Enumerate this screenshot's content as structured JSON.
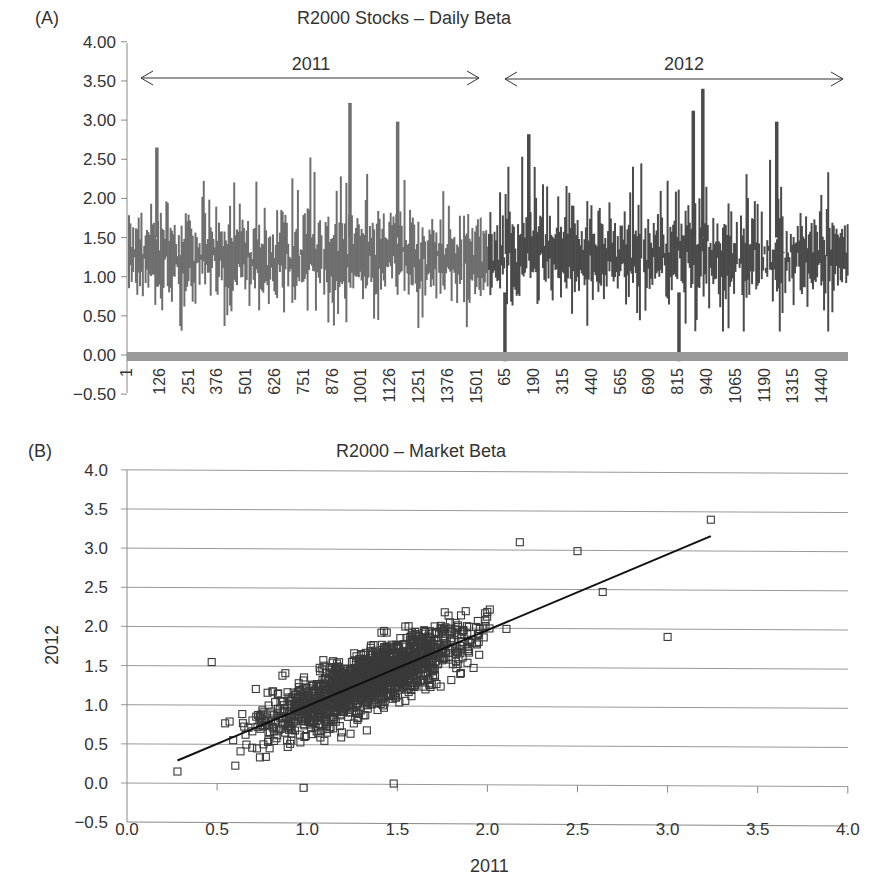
{
  "panelA": {
    "label": "(A)",
    "title": "R2000 Stocks – Daily Beta",
    "year_left": "2011",
    "year_right": "2012",
    "y_ticks": [
      "4.00",
      "3.50",
      "3.00",
      "2.50",
      "2.00",
      "1.50",
      "1.00",
      "0.50",
      "0.00",
      "−0.50"
    ],
    "x_ticks_2011": [
      "1",
      "126",
      "251",
      "376",
      "501",
      "626",
      "751",
      "876",
      "1001",
      "1126",
      "1251",
      "1376",
      "1501"
    ],
    "x_ticks_2012": [
      "65",
      "190",
      "315",
      "440",
      "565",
      "690",
      "815",
      "940",
      "1065",
      "1190",
      "1315",
      "1440"
    ],
    "colors": {
      "series_2011": "#6e6e6e",
      "series_2012": "#4a4a4a",
      "zero_band": "#9a9a9a"
    }
  },
  "panelB": {
    "label": "(B)",
    "title": "R2000 – Market Beta",
    "x_title": "2011",
    "y_title": "2012",
    "y_ticks": [
      "4.0",
      "3.5",
      "3.0",
      "2.5",
      "2.0",
      "1.5",
      "1.0",
      "0.5",
      "0.0",
      "−0.5"
    ],
    "x_ticks": [
      "0.0",
      "0.5",
      "1.0",
      "1.5",
      "2.0",
      "2.5",
      "3.0",
      "3.5",
      "4.0"
    ],
    "colors": {
      "marker": "#3a3a3a",
      "trend": "#111111",
      "grid": "#999999"
    }
  },
  "chart_data": [
    {
      "type": "bar",
      "title": "R2000 Stocks – Daily Beta",
      "xlabel": "",
      "ylabel": "",
      "ylim": [
        -0.5,
        4.0
      ],
      "grid": false,
      "annotations": [
        {
          "text": "2011",
          "span": "left half (obs 1–~1510)"
        },
        {
          "text": "2012",
          "span": "right half (obs 1–~1510)"
        }
      ],
      "categories_2011": [
        "1",
        "126",
        "251",
        "376",
        "501",
        "626",
        "751",
        "876",
        "1001",
        "1126",
        "1251",
        "1376",
        "1501"
      ],
      "categories_2012": [
        "65",
        "190",
        "315",
        "440",
        "565",
        "690",
        "815",
        "940",
        "1065",
        "1190",
        "1315",
        "1440"
      ],
      "series": [
        {
          "name": "2011",
          "typical_range": [
            0.7,
            2.0
          ],
          "max": 3.22,
          "min": 0.27,
          "notable_peaks": [
            {
              "obs": 930,
              "value": 3.22
            },
            {
              "obs": 1130,
              "value": 2.98
            },
            {
              "obs": 120,
              "value": 2.65
            }
          ]
        },
        {
          "name": "2012",
          "typical_range": [
            0.6,
            2.0
          ],
          "max": 3.4,
          "min": -0.08,
          "notable_peaks": [
            {
              "obs": 900,
              "value": 3.4
            },
            {
              "obs": 860,
              "value": 3.12
            },
            {
              "obs": 1210,
              "value": 2.98
            },
            {
              "obs": 170,
              "value": 2.82
            }
          ],
          "notable_troughs": [
            {
              "obs": 70,
              "value": -0.08
            },
            {
              "obs": 800,
              "value": -0.08
            }
          ]
        }
      ]
    },
    {
      "type": "scatter",
      "title": "R2000 – Market Beta",
      "xlabel": "2011",
      "ylabel": "2012",
      "xlim": [
        0.0,
        4.0
      ],
      "ylim": [
        -0.5,
        4.0
      ],
      "grid": "horizontal",
      "marker": "open square",
      "trendline": {
        "x": [
          0.28,
          3.24
        ],
        "y": [
          0.29,
          3.19
        ]
      },
      "outliers": [
        {
          "x": 3.24,
          "y": 3.4
        },
        {
          "x": 3.0,
          "y": 1.9
        },
        {
          "x": 2.5,
          "y": 2.99
        },
        {
          "x": 2.18,
          "y": 3.1
        },
        {
          "x": 0.28,
          "y": 0.15
        },
        {
          "x": 0.98,
          "y": -0.05
        },
        {
          "x": 1.48,
          "y": 0.01
        },
        {
          "x": 0.47,
          "y": 1.55
        },
        {
          "x": 2.64,
          "y": 2.47
        }
      ],
      "cluster": {
        "x_center": 1.35,
        "y_center": 1.25,
        "x_range": [
          0.3,
          2.6
        ],
        "y_range": [
          0.0,
          3.1
        ]
      }
    }
  ]
}
